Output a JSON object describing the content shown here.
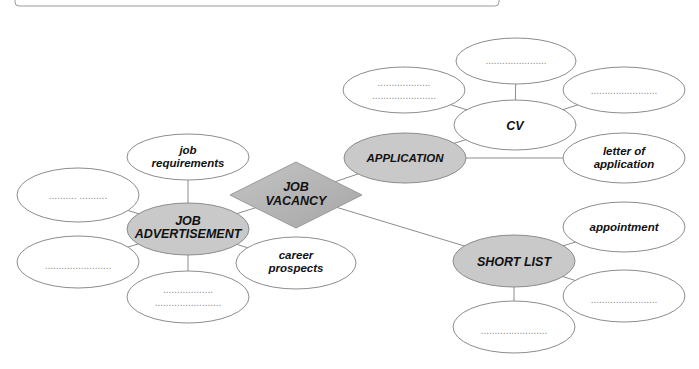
{
  "diagram": {
    "colors": {
      "line": "#8c8c8c",
      "empty_fill": "#ffffff",
      "key_fill": "#c9c9c9",
      "diamond_fill": "#b5b5b5",
      "text": "#111111",
      "placeholder": "#8a8a8a"
    },
    "center": {
      "label_line1": "JOB",
      "label_line2": "VACANCY"
    },
    "nodes": {
      "application": {
        "label": "APPLICATION"
      },
      "cv": {
        "label": "CV"
      },
      "cv_top": {
        "label": "......................"
      },
      "cv_left": {
        "label_line1": "...................",
        "label_line2": "......................."
      },
      "cv_right": {
        "label": "........................"
      },
      "letter": {
        "label_line1": "letter of",
        "label_line2": "application"
      },
      "job_ad": {
        "label_line1": "JOB",
        "label_line2": "ADVERTISEMENT"
      },
      "job_requirements": {
        "label_line1": "job",
        "label_line2": "requirements"
      },
      "ad_upper_left": {
        "label": "..........   .........."
      },
      "ad_lower_left": {
        "label": "........................"
      },
      "ad_bottom": {
        "label_line1": "..................",
        "label_line2": "........................"
      },
      "career": {
        "label_line1": "career",
        "label_line2": "prospects"
      },
      "short_list": {
        "label": "SHORT LIST"
      },
      "appointment": {
        "label": "appointment"
      },
      "sl_right": {
        "label": "........................"
      },
      "sl_bottom": {
        "label": "........................"
      }
    }
  }
}
